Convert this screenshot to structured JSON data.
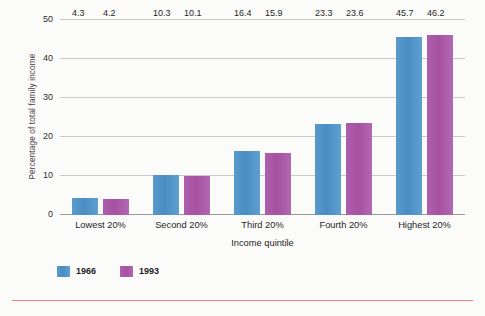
{
  "chart_data": {
    "type": "bar",
    "title": "",
    "subtitle": "",
    "xlabel": "Income quintile",
    "ylabel": "Percentage of total family income",
    "ylim": [
      0,
      50
    ],
    "yticks": [
      0,
      10,
      20,
      30,
      40,
      50
    ],
    "ytick_labels": [
      "0",
      "10",
      "20",
      "30",
      "40",
      "50"
    ],
    "grid": "horizontal",
    "legend_position": "bottom-left",
    "categories": [
      "Lowest 20%",
      "Second 20%",
      "Third 20%",
      "Fourth 20%",
      "Highest 20%"
    ],
    "series": [
      {
        "name": "1966",
        "color": "#4a8dc2",
        "values": [
          4.3,
          10.3,
          16.4,
          23.3,
          45.7
        ],
        "value_labels": [
          "4.3",
          "10.3",
          "16.4",
          "23.3",
          "45.7"
        ]
      },
      {
        "name": "1993",
        "color": "#a6519f",
        "values": [
          4.2,
          10.1,
          15.9,
          23.6,
          46.2
        ],
        "value_labels": [
          "4.2",
          "10.1",
          "15.9",
          "23.6",
          "46.2"
        ]
      }
    ]
  },
  "legend": {
    "items": [
      {
        "label": "1966",
        "color": "#4a8dc2"
      },
      {
        "label": "1993",
        "color": "#a6519f"
      }
    ]
  },
  "colors": {
    "background": "#fbfbf9",
    "gridline": "#c9c9c9",
    "axis": "#9a9a9a",
    "series_1966": "#4a8dc2",
    "series_1993": "#a6519f",
    "ylabel_text": "#4a3d3f",
    "bottom_rule": "#f08070"
  }
}
